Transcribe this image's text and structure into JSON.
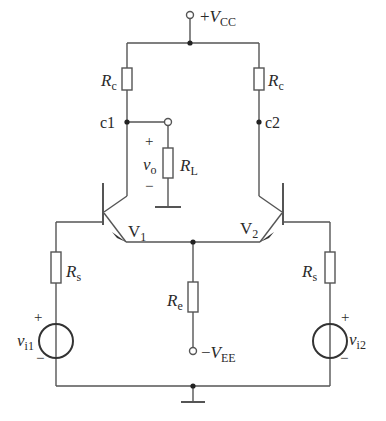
{
  "colors": {
    "wire": "#555555",
    "text": "#2a2a2a",
    "background": "#ffffff"
  },
  "labels": {
    "vcc": {
      "sign": "+",
      "sym": "V",
      "sub": "CC"
    },
    "vee": {
      "sign": "−",
      "sym": "V",
      "sub": "EE"
    },
    "rc_left": {
      "sym": "R",
      "sub": "c"
    },
    "rc_right": {
      "sym": "R",
      "sub": "c"
    },
    "rl": {
      "sym": "R",
      "sub": "L"
    },
    "re": {
      "sym": "R",
      "sub": "e"
    },
    "rs_left": {
      "sym": "R",
      "sub": "s"
    },
    "rs_right": {
      "sym": "R",
      "sub": "s"
    },
    "v1": {
      "sym": "V",
      "sub": "1"
    },
    "v2": {
      "sym": "V",
      "sub": "2"
    },
    "c1": "c1",
    "c2": "c2",
    "vo": {
      "sym": "v",
      "sub": "o",
      "plus": "+",
      "minus": "−"
    },
    "vi1": {
      "sym": "v",
      "sub": "i1",
      "plus": "+",
      "minus": "−"
    },
    "vi2": {
      "sym": "v",
      "sub": "i2",
      "plus": "+",
      "minus": "−"
    }
  }
}
